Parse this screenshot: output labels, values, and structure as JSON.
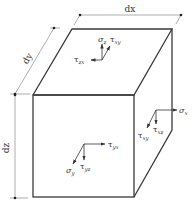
{
  "diagram": {
    "dimensions": {
      "dx": "dx",
      "dy": "dy",
      "dz": "dz"
    },
    "top_face": {
      "normal_stress": {
        "symbol": "σ",
        "sub": "z"
      },
      "shear_1": {
        "symbol": "τ",
        "sub": "xy"
      },
      "shear_2": {
        "symbol": "τ",
        "sub": "zx"
      }
    },
    "right_face": {
      "normal_stress": {
        "symbol": "σ",
        "sub": "x"
      },
      "shear_1": {
        "symbol": "τ",
        "sub": "xz"
      },
      "shear_2": {
        "symbol": "τ",
        "sub": "xy"
      }
    },
    "front_face": {
      "normal_stress": {
        "symbol": "σ",
        "sub": "y"
      },
      "shear_1": {
        "symbol": "τ",
        "sub": "yx"
      },
      "shear_2": {
        "symbol": "τ",
        "sub": "yz"
      }
    },
    "colors": {
      "edge": "#3a3a3a",
      "dimension": "#777777",
      "background": "#ffffff"
    }
  }
}
